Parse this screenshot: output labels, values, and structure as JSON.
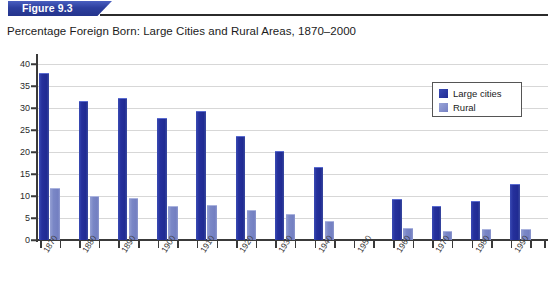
{
  "figure": {
    "banner_label": "Figure 9.3",
    "title": "Percentage Foreign Born: Large Cities and Rural Areas, 1870–2000"
  },
  "legend": {
    "position": "top-right",
    "entries": [
      {
        "label": "Large cities",
        "color": "#24309c"
      },
      {
        "label": "Rural",
        "color": "#7b87c4"
      }
    ]
  },
  "chart_data": {
    "type": "bar",
    "title": "Percentage Foreign Born: Large Cities and Rural Areas, 1870–2000",
    "xlabel": "",
    "ylabel": "",
    "ylim": [
      0,
      40
    ],
    "yticks": [
      0,
      5,
      10,
      15,
      20,
      25,
      30,
      35,
      40
    ],
    "grid": true,
    "legend_position": "top-right",
    "categories": [
      "1870",
      "1880",
      "1890",
      "1900",
      "1910",
      "1920",
      "1930",
      "1940",
      "1950",
      "1960",
      "1970",
      "1980",
      "1990"
    ],
    "series": [
      {
        "name": "Large cities",
        "color": "#24309c",
        "values": [
          37.8,
          31.3,
          32.0,
          27.4,
          29.0,
          23.5,
          20.0,
          16.3,
          null,
          9.0,
          7.6,
          8.7,
          12.5
        ]
      },
      {
        "name": "Rural",
        "color": "#7b87c4",
        "values": [
          11.5,
          9.8,
          9.4,
          7.6,
          7.8,
          6.7,
          5.6,
          4.2,
          null,
          2.4,
          1.8,
          2.2,
          2.3
        ]
      }
    ]
  }
}
